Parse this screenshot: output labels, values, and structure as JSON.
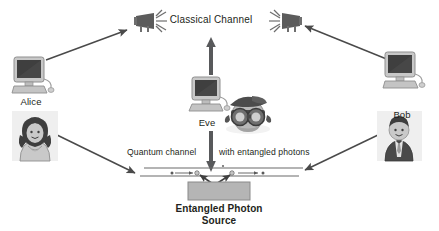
{
  "diagram": {
    "title_text": "",
    "background_color": "#ffffff",
    "ink_color": "#4d4d4d",
    "text_color": "#231f20",
    "source_box_color": "#b3b3b3"
  },
  "labels": {
    "alice": "Alice",
    "bob": "Bob",
    "eve": "Eve",
    "classical_channel": "Classical Channel",
    "quantum_channel_left": "Quantum channel",
    "quantum_channel_right": "with entangled photons",
    "entangled_source_line1": "Entangled Photon",
    "entangled_source_line2": "Source"
  },
  "icons": {
    "alice_computer": "desktop-computer-icon",
    "bob_computer": "desktop-computer-icon",
    "eve_computer": "desktop-computer-icon",
    "alice_person": "woman-avatar-icon",
    "bob_person": "businessman-avatar-icon",
    "eve_person": "spy-goggles-avatar-icon",
    "left_transmitter": "antenna-transmitter-icon",
    "right_transmitter": "antenna-transmitter-icon",
    "photon_source": "entangled-photon-source-box"
  },
  "connections": [
    {
      "name": "alice-computer-to-left-transmitter",
      "from": "alice_computer",
      "to": "left_transmitter",
      "style": "thin-arrow"
    },
    {
      "name": "bob-computer-to-right-transmitter",
      "from": "bob_computer",
      "to": "right_transmitter",
      "style": "thin-arrow"
    },
    {
      "name": "eve-to-classical-channel",
      "from": "eve_computer",
      "to": "classical_channel",
      "style": "thick-arrow-up"
    },
    {
      "name": "eve-to-quantum-channel",
      "from": "eve_computer",
      "to": "quantum_channel",
      "style": "thick-arrow-down"
    },
    {
      "name": "alice-person-to-quantum-channel",
      "from": "alice_person",
      "to": "quantum_channel",
      "style": "thin-arrow"
    },
    {
      "name": "bob-person-to-quantum-channel",
      "from": "bob_person",
      "to": "quantum_channel",
      "style": "thin-arrow"
    },
    {
      "name": "source-to-channel-left",
      "from": "photon_source",
      "to": "quantum_channel",
      "style": "photon-arrow"
    },
    {
      "name": "source-to-channel-right",
      "from": "photon_source",
      "to": "quantum_channel",
      "style": "photon-arrow"
    }
  ]
}
